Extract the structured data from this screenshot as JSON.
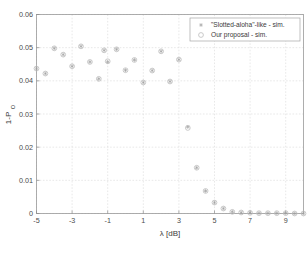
{
  "figure": {
    "background": "#ffffff",
    "plot_background": "#ffffff",
    "grid_color": "#d9d9d9",
    "frame_color": "#9a9a9a",
    "series_colors": {
      "slotted_aloha": "#9e9e9e",
      "our_proposal": "#b9b9b9"
    }
  },
  "chart_data": {
    "type": "scatter",
    "title": "",
    "xlabel": "λ [dB]",
    "ylabel": "1-P",
    "ylabel_sub": "O",
    "xlim": [
      -5,
      10
    ],
    "ylim": [
      0,
      0.06
    ],
    "xticks": [
      -5,
      -3,
      -1,
      1,
      3,
      5,
      7,
      9
    ],
    "xtick_labels": [
      "-5",
      "-3",
      "-1",
      "1",
      "3",
      "5",
      "7",
      "9"
    ],
    "yticks": [
      0,
      0.01,
      0.02,
      0.03,
      0.04,
      0.05,
      0.06
    ],
    "ytick_labels": [
      "0",
      "0.01",
      "0.02",
      "0.03",
      "0.04",
      "0.05",
      "0.06"
    ],
    "grid": true,
    "legend_position": "upper right",
    "series": [
      {
        "name": "\"Slotted-aloha\"-like - sim.",
        "marker": "star",
        "color": "#9e9e9e",
        "points": [
          [
            -5.0,
            0.0437
          ],
          [
            -4.5,
            0.0422
          ],
          [
            -4.0,
            0.0498
          ],
          [
            -3.5,
            0.0479
          ],
          [
            -3.0,
            0.0444
          ],
          [
            -2.5,
            0.0504
          ],
          [
            -2.0,
            0.0457
          ],
          [
            -1.5,
            0.0406
          ],
          [
            -1.2,
            0.0492
          ],
          [
            -1.0,
            0.0457
          ],
          [
            -0.5,
            0.0495
          ],
          [
            0.0,
            0.0432
          ],
          [
            0.5,
            0.0463
          ],
          [
            1.0,
            0.0395
          ],
          [
            1.5,
            0.0431
          ],
          [
            2.0,
            0.0489
          ],
          [
            2.5,
            0.0398
          ],
          [
            3.0,
            0.0464
          ],
          [
            3.5,
            0.0261
          ],
          [
            4.0,
            0.0138
          ],
          [
            4.5,
            0.0068
          ],
          [
            5.0,
            0.0033
          ],
          [
            5.5,
            0.0015
          ],
          [
            6.0,
            0.0005
          ],
          [
            6.5,
            0.0003
          ],
          [
            7.0,
            0.0002
          ],
          [
            7.5,
            0.0001
          ],
          [
            8.0,
            0.0001
          ],
          [
            8.5,
            0.0001
          ],
          [
            9.0,
            0.0001
          ],
          [
            9.5,
            0.0
          ],
          [
            10.0,
            0.0
          ]
        ]
      },
      {
        "name": "Our proposal - sim.",
        "marker": "circle",
        "color": "#b9b9b9",
        "points": [
          [
            -5.0,
            0.0437
          ],
          [
            -4.5,
            0.0422
          ],
          [
            -4.0,
            0.0498
          ],
          [
            -3.5,
            0.0479
          ],
          [
            -3.0,
            0.0444
          ],
          [
            -2.5,
            0.0504
          ],
          [
            -2.0,
            0.0457
          ],
          [
            -1.5,
            0.0406
          ],
          [
            -1.2,
            0.0492
          ],
          [
            -1.0,
            0.0459
          ],
          [
            -0.5,
            0.0495
          ],
          [
            0.0,
            0.0432
          ],
          [
            0.5,
            0.0463
          ],
          [
            1.0,
            0.0395
          ],
          [
            1.5,
            0.0431
          ],
          [
            2.0,
            0.0489
          ],
          [
            2.5,
            0.0398
          ],
          [
            3.0,
            0.0464
          ],
          [
            3.5,
            0.0258
          ],
          [
            4.0,
            0.0138
          ],
          [
            4.5,
            0.0068
          ],
          [
            5.0,
            0.0033
          ],
          [
            5.5,
            0.0015
          ],
          [
            6.0,
            0.0005
          ],
          [
            6.5,
            0.0003
          ],
          [
            7.0,
            0.0002
          ],
          [
            7.5,
            0.0001
          ],
          [
            8.0,
            0.0001
          ],
          [
            8.5,
            0.0001
          ],
          [
            9.0,
            0.0001
          ],
          [
            9.5,
            0.0
          ],
          [
            10.0,
            0.0
          ]
        ]
      }
    ],
    "legend": [
      {
        "label": "\"Slotted-aloha\"-like - sim.",
        "marker": "star"
      },
      {
        "label": "Our proposal - sim.",
        "marker": "circle"
      }
    ]
  }
}
